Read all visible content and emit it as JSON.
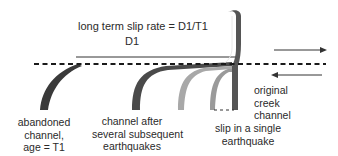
{
  "diagram": {
    "title_formula": "long term slip rate = D1/T1",
    "offset_label": "D1",
    "labels": {
      "abandoned_channel": [
        "abandoned",
        "channel,",
        "age = T1"
      ],
      "channel_after": [
        "channel after",
        "several subsequent",
        "earthquakes"
      ],
      "single_slip": [
        "slip in a single",
        "earthquake"
      ],
      "original_channel": [
        "original",
        "creek",
        "channel"
      ]
    },
    "fault_line": {
      "style": "dashed",
      "color": "#1a1a1a"
    },
    "motion_arrows": [
      {
        "direction": "right",
        "side": "top"
      },
      {
        "direction": "left",
        "side": "bottom"
      }
    ],
    "colors": {
      "dark_channel": "#3a3a3a",
      "mid_channel": "#6a6a6a",
      "light_channel": "#a9a9a9",
      "lighter_channel": "#bdbdbd",
      "original_channel": "#555555"
    }
  }
}
